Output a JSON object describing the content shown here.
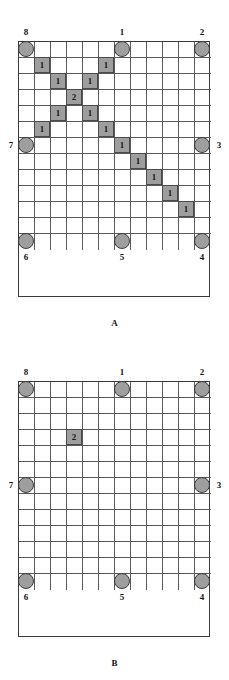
{
  "page": {
    "background_color": "#ffffff",
    "node_fill_color": "#9e9e9e",
    "node_border_color": "#3c3c3c",
    "cell_fill_color": "#9e9e9e",
    "grid_line_color": "#5a5a5a",
    "grid_border_color": "#3a3a3a"
  },
  "grid": {
    "columns": 12,
    "rows": 13,
    "cell_size_px": 16
  },
  "figures": [
    {
      "id": "A",
      "caption": "A",
      "nodes": [
        {
          "label": "1",
          "col": 6,
          "row": 0,
          "label_pos": "top"
        },
        {
          "label": "2",
          "col": 11,
          "row": 0,
          "label_pos": "top"
        },
        {
          "label": "3",
          "col": 11,
          "row": 6,
          "label_pos": "right"
        },
        {
          "label": "4",
          "col": 11,
          "row": 12,
          "label_pos": "bottom"
        },
        {
          "label": "5",
          "col": 6,
          "row": 12,
          "label_pos": "bottom"
        },
        {
          "label": "6",
          "col": 0,
          "row": 12,
          "label_pos": "bottom"
        },
        {
          "label": "7",
          "col": 0,
          "row": 6,
          "label_pos": "left"
        },
        {
          "label": "8",
          "col": 0,
          "row": 0,
          "label_pos": "top"
        }
      ],
      "shaded_cells": [
        {
          "col": 1,
          "row": 1,
          "value": "1"
        },
        {
          "col": 5,
          "row": 1,
          "value": "1"
        },
        {
          "col": 2,
          "row": 2,
          "value": "1"
        },
        {
          "col": 4,
          "row": 2,
          "value": "1"
        },
        {
          "col": 3,
          "row": 3,
          "value": "2"
        },
        {
          "col": 2,
          "row": 4,
          "value": "1"
        },
        {
          "col": 4,
          "row": 4,
          "value": "1"
        },
        {
          "col": 1,
          "row": 5,
          "value": "1"
        },
        {
          "col": 5,
          "row": 5,
          "value": "1"
        },
        {
          "col": 6,
          "row": 6,
          "value": "1"
        },
        {
          "col": 7,
          "row": 7,
          "value": "1"
        },
        {
          "col": 8,
          "row": 8,
          "value": "1"
        },
        {
          "col": 9,
          "row": 9,
          "value": "1"
        },
        {
          "col": 10,
          "row": 10,
          "value": "1"
        }
      ]
    },
    {
      "id": "B",
      "caption": "B",
      "nodes": [
        {
          "label": "1",
          "col": 6,
          "row": 0,
          "label_pos": "top"
        },
        {
          "label": "2",
          "col": 11,
          "row": 0,
          "label_pos": "top"
        },
        {
          "label": "3",
          "col": 11,
          "row": 6,
          "label_pos": "right"
        },
        {
          "label": "4",
          "col": 11,
          "row": 12,
          "label_pos": "bottom"
        },
        {
          "label": "5",
          "col": 6,
          "row": 12,
          "label_pos": "bottom"
        },
        {
          "label": "6",
          "col": 0,
          "row": 12,
          "label_pos": "bottom"
        },
        {
          "label": "7",
          "col": 0,
          "row": 6,
          "label_pos": "left"
        },
        {
          "label": "8",
          "col": 0,
          "row": 0,
          "label_pos": "top"
        }
      ],
      "shaded_cells": [
        {
          "col": 3,
          "row": 3,
          "value": "2"
        }
      ]
    }
  ]
}
